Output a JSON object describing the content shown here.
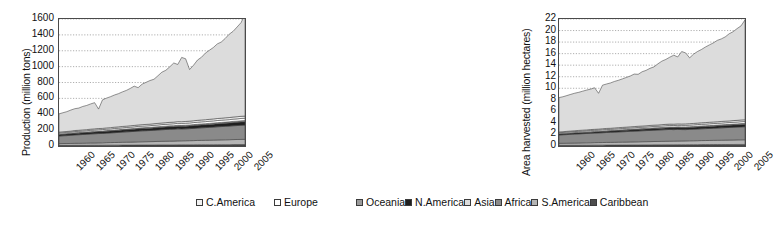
{
  "legend": {
    "position": "bottom",
    "columns": 2,
    "items": [
      {
        "label": "C.America",
        "color": "#f2f2f2"
      },
      {
        "label": "Europe",
        "color": "#ffffff"
      },
      {
        "label": "Oceania",
        "color": "#9a9a9a"
      },
      {
        "label": "N.America",
        "color": "#1f1f1f"
      },
      {
        "label": "Asia",
        "color": "#dcdcdc"
      },
      {
        "label": "Africa",
        "color": "#8a8a8a"
      },
      {
        "label": "S.America",
        "color": "#b5b5b5"
      },
      {
        "label": "Caribbean",
        "color": "#4d4d4d"
      }
    ]
  },
  "chart_data": [
    {
      "id": "production",
      "type": "area",
      "stacked": true,
      "title": "",
      "xlabel": "",
      "ylabel": "Production (million tons)",
      "ylim": [
        0,
        1600
      ],
      "yticks": [
        0,
        200,
        400,
        600,
        800,
        1000,
        1200,
        1400,
        1600
      ],
      "grid": true,
      "xlim": [
        1960,
        2007
      ],
      "xticks": [
        1960,
        1965,
        1970,
        1975,
        1980,
        1985,
        1990,
        1995,
        2000,
        2005
      ],
      "x": [
        1960,
        1961,
        1962,
        1963,
        1964,
        1965,
        1966,
        1967,
        1968,
        1969,
        1970,
        1971,
        1972,
        1973,
        1974,
        1975,
        1976,
        1977,
        1978,
        1979,
        1980,
        1981,
        1982,
        1983,
        1984,
        1985,
        1986,
        1987,
        1988,
        1989,
        1990,
        1991,
        1992,
        1993,
        1994,
        1995,
        1996,
        1997,
        1998,
        1999,
        2000,
        2001,
        2002,
        2003,
        2004,
        2005,
        2006,
        2007
      ],
      "series": [
        {
          "name": "Caribbean",
          "color": "#4d4d4d",
          "values": [
            8,
            8,
            8,
            8,
            9,
            9,
            9,
            9,
            10,
            10,
            10,
            10,
            11,
            11,
            11,
            11,
            12,
            12,
            12,
            12,
            13,
            13,
            13,
            13,
            13,
            14,
            14,
            14,
            14,
            14,
            15,
            15,
            15,
            15,
            15,
            16,
            16,
            16,
            16,
            16,
            17,
            17,
            17,
            17,
            18,
            18,
            18,
            18
          ]
        },
        {
          "name": "S.America",
          "color": "#b5b5b5",
          "values": [
            22,
            23,
            23,
            24,
            25,
            25,
            26,
            27,
            28,
            28,
            29,
            30,
            31,
            32,
            33,
            34,
            35,
            36,
            37,
            38,
            39,
            40,
            41,
            42,
            43,
            44,
            45,
            46,
            47,
            48,
            49,
            50,
            51,
            52,
            53,
            54,
            55,
            56,
            57,
            58,
            59,
            60,
            61,
            62,
            63,
            64,
            65,
            66
          ]
        },
        {
          "name": "Africa",
          "color": "#8a8a8a",
          "values": [
            95,
            98,
            100,
            103,
            106,
            108,
            110,
            112,
            114,
            116,
            118,
            118,
            120,
            122,
            124,
            126,
            128,
            130,
            132,
            134,
            136,
            138,
            139,
            140,
            142,
            144,
            146,
            148,
            150,
            150,
            152,
            150,
            150,
            152,
            154,
            156,
            158,
            160,
            162,
            164,
            166,
            168,
            170,
            172,
            174,
            176,
            178,
            180
          ]
        },
        {
          "name": "N.America",
          "color": "#1f1f1f",
          "values": [
            18,
            18,
            19,
            19,
            20,
            20,
            21,
            21,
            22,
            22,
            23,
            23,
            24,
            24,
            25,
            25,
            26,
            26,
            27,
            27,
            28,
            28,
            29,
            29,
            30,
            30,
            31,
            31,
            32,
            32,
            33,
            33,
            34,
            34,
            35,
            35,
            36,
            36,
            37,
            37,
            38,
            38,
            39,
            39,
            40,
            40,
            41,
            41
          ]
        },
        {
          "name": "Oceania",
          "color": "#9a9a9a",
          "values": [
            6,
            6,
            6,
            6,
            7,
            7,
            7,
            7,
            7,
            8,
            8,
            8,
            8,
            8,
            9,
            9,
            9,
            9,
            9,
            10,
            10,
            10,
            10,
            10,
            11,
            11,
            11,
            11,
            11,
            12,
            12,
            12,
            12,
            12,
            13,
            13,
            13,
            13,
            13,
            14,
            14,
            14,
            14,
            14,
            15,
            15,
            15,
            15
          ]
        },
        {
          "name": "Europe",
          "color": "#ffffff",
          "values": [
            14,
            14,
            15,
            15,
            15,
            16,
            16,
            16,
            17,
            17,
            17,
            18,
            18,
            18,
            19,
            19,
            19,
            20,
            20,
            20,
            21,
            21,
            21,
            22,
            22,
            22,
            23,
            23,
            23,
            24,
            24,
            24,
            25,
            25,
            25,
            26,
            26,
            26,
            27,
            27,
            27,
            28,
            28,
            28,
            29,
            29,
            30,
            30
          ]
        },
        {
          "name": "C.America",
          "color": "#f2f2f2",
          "values": [
            12,
            12,
            12,
            13,
            13,
            13,
            14,
            14,
            14,
            15,
            15,
            15,
            16,
            16,
            16,
            17,
            17,
            17,
            18,
            18,
            18,
            19,
            19,
            19,
            20,
            20,
            20,
            21,
            21,
            21,
            22,
            22,
            22,
            23,
            23,
            23,
            24,
            24,
            24,
            25,
            25,
            25,
            26,
            26,
            26,
            27,
            27,
            27
          ]
        },
        {
          "name": "Asia",
          "color": "#dcdcdc",
          "values": [
            230,
            240,
            250,
            265,
            275,
            280,
            295,
            305,
            318,
            330,
            245,
            360,
            375,
            390,
            405,
            418,
            435,
            450,
            470,
            495,
            470,
            510,
            530,
            550,
            560,
            600,
            640,
            660,
            700,
            745,
            720,
            810,
            790,
            650,
            700,
            760,
            790,
            840,
            870,
            900,
            940,
            960,
            1000,
            1050,
            1080,
            1130,
            1180,
            1280
          ]
        }
      ]
    },
    {
      "id": "area-harvested",
      "type": "area",
      "stacked": true,
      "title": "",
      "xlabel": "",
      "ylabel": "Area harvested (million hectares)",
      "ylim": [
        0,
        22
      ],
      "yticks": [
        0,
        2,
        4,
        6,
        8,
        10,
        12,
        14,
        16,
        18,
        20,
        22
      ],
      "grid": true,
      "xlim": [
        1960,
        2007
      ],
      "xticks": [
        1960,
        1965,
        1970,
        1975,
        1980,
        1985,
        1990,
        1995,
        2000,
        2005
      ],
      "x": [
        1960,
        1961,
        1962,
        1963,
        1964,
        1965,
        1966,
        1967,
        1968,
        1969,
        1970,
        1971,
        1972,
        1973,
        1974,
        1975,
        1976,
        1977,
        1978,
        1979,
        1980,
        1981,
        1982,
        1983,
        1984,
        1985,
        1986,
        1987,
        1988,
        1989,
        1990,
        1991,
        1992,
        1993,
        1994,
        1995,
        1996,
        1997,
        1998,
        1999,
        2000,
        2001,
        2002,
        2003,
        2004,
        2005,
        2006,
        2007
      ],
      "series": [
        {
          "name": "Caribbean",
          "color": "#4d4d4d",
          "values": [
            0.12,
            0.12,
            0.12,
            0.13,
            0.13,
            0.13,
            0.14,
            0.14,
            0.14,
            0.15,
            0.15,
            0.15,
            0.16,
            0.16,
            0.16,
            0.17,
            0.17,
            0.17,
            0.18,
            0.18,
            0.18,
            0.19,
            0.19,
            0.19,
            0.2,
            0.2,
            0.2,
            0.21,
            0.21,
            0.21,
            0.22,
            0.22,
            0.22,
            0.23,
            0.23,
            0.23,
            0.24,
            0.24,
            0.24,
            0.25,
            0.25,
            0.25,
            0.26,
            0.26,
            0.26,
            0.27,
            0.27,
            0.27
          ]
        },
        {
          "name": "S.America",
          "color": "#b5b5b5",
          "values": [
            0.34,
            0.35,
            0.36,
            0.37,
            0.38,
            0.39,
            0.4,
            0.41,
            0.42,
            0.43,
            0.44,
            0.45,
            0.46,
            0.47,
            0.48,
            0.49,
            0.5,
            0.51,
            0.52,
            0.53,
            0.54,
            0.55,
            0.56,
            0.57,
            0.58,
            0.59,
            0.6,
            0.61,
            0.62,
            0.63,
            0.64,
            0.65,
            0.66,
            0.67,
            0.68,
            0.69,
            0.7,
            0.71,
            0.72,
            0.73,
            0.74,
            0.75,
            0.76,
            0.77,
            0.78,
            0.79,
            0.8,
            0.81
          ]
        },
        {
          "name": "Africa",
          "color": "#8a8a8a",
          "values": [
            1.45,
            1.48,
            1.5,
            1.53,
            1.56,
            1.58,
            1.6,
            1.62,
            1.64,
            1.66,
            1.68,
            1.7,
            1.72,
            1.74,
            1.76,
            1.78,
            1.8,
            1.82,
            1.84,
            1.86,
            1.88,
            1.9,
            1.92,
            1.94,
            1.96,
            1.98,
            2.0,
            2.02,
            2.04,
            2.0,
            2.02,
            1.98,
            1.96,
            1.98,
            2.0,
            2.02,
            2.04,
            2.06,
            2.08,
            2.1,
            2.12,
            2.14,
            2.16,
            2.18,
            2.2,
            2.22,
            2.24,
            2.26
          ]
        },
        {
          "name": "N.America",
          "color": "#1f1f1f",
          "values": [
            0.16,
            0.16,
            0.17,
            0.17,
            0.18,
            0.18,
            0.19,
            0.19,
            0.2,
            0.2,
            0.21,
            0.21,
            0.22,
            0.22,
            0.23,
            0.23,
            0.24,
            0.24,
            0.25,
            0.25,
            0.26,
            0.26,
            0.27,
            0.27,
            0.28,
            0.28,
            0.29,
            0.29,
            0.3,
            0.3,
            0.31,
            0.31,
            0.32,
            0.32,
            0.33,
            0.33,
            0.34,
            0.34,
            0.35,
            0.35,
            0.36,
            0.36,
            0.37,
            0.37,
            0.38,
            0.38,
            0.39,
            0.39
          ]
        },
        {
          "name": "Oceania",
          "color": "#9a9a9a",
          "values": [
            0.06,
            0.06,
            0.06,
            0.07,
            0.07,
            0.07,
            0.07,
            0.08,
            0.08,
            0.08,
            0.08,
            0.09,
            0.09,
            0.09,
            0.09,
            0.1,
            0.1,
            0.1,
            0.1,
            0.11,
            0.11,
            0.11,
            0.11,
            0.12,
            0.12,
            0.12,
            0.12,
            0.13,
            0.13,
            0.13,
            0.13,
            0.14,
            0.14,
            0.14,
            0.14,
            0.15,
            0.15,
            0.15,
            0.15,
            0.16,
            0.16,
            0.16,
            0.16,
            0.17,
            0.17,
            0.17,
            0.18,
            0.18
          ]
        },
        {
          "name": "Europe",
          "color": "#ffffff",
          "values": [
            0.17,
            0.17,
            0.18,
            0.18,
            0.18,
            0.19,
            0.19,
            0.19,
            0.2,
            0.2,
            0.2,
            0.21,
            0.21,
            0.21,
            0.22,
            0.22,
            0.22,
            0.23,
            0.23,
            0.23,
            0.24,
            0.24,
            0.24,
            0.25,
            0.25,
            0.25,
            0.26,
            0.26,
            0.26,
            0.27,
            0.27,
            0.27,
            0.28,
            0.28,
            0.28,
            0.29,
            0.29,
            0.29,
            0.3,
            0.3,
            0.3,
            0.31,
            0.31,
            0.31,
            0.32,
            0.32,
            0.33,
            0.33
          ]
        },
        {
          "name": "C.America",
          "color": "#f2f2f2",
          "values": [
            0.14,
            0.14,
            0.15,
            0.15,
            0.15,
            0.16,
            0.16,
            0.16,
            0.17,
            0.17,
            0.17,
            0.18,
            0.18,
            0.18,
            0.19,
            0.19,
            0.19,
            0.2,
            0.2,
            0.2,
            0.21,
            0.21,
            0.21,
            0.22,
            0.22,
            0.22,
            0.23,
            0.23,
            0.23,
            0.24,
            0.24,
            0.24,
            0.25,
            0.25,
            0.25,
            0.26,
            0.26,
            0.26,
            0.27,
            0.27,
            0.27,
            0.28,
            0.28,
            0.28,
            0.29,
            0.29,
            0.3,
            0.3
          ]
        },
        {
          "name": "Asia",
          "color": "#dcdcdc",
          "values": [
            5.95,
            6.05,
            6.2,
            6.35,
            6.5,
            6.6,
            6.75,
            6.9,
            7.0,
            7.2,
            6.2,
            7.55,
            7.7,
            7.85,
            8.05,
            8.2,
            8.4,
            8.6,
            8.8,
            9.1,
            9.0,
            9.4,
            9.6,
            9.9,
            10.1,
            10.6,
            11.0,
            11.25,
            11.6,
            11.95,
            11.6,
            12.55,
            12.3,
            11.4,
            12.0,
            12.4,
            12.7,
            13.1,
            13.4,
            13.7,
            14.1,
            14.3,
            14.6,
            15.1,
            15.4,
            15.9,
            16.3,
            17.3
          ]
        }
      ]
    }
  ]
}
